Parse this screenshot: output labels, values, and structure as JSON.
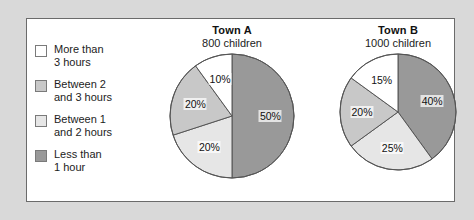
{
  "legend": {
    "items": [
      {
        "label": "More than\n3 hours",
        "color": "#ffffff"
      },
      {
        "label": "Between 2\nand 3 hours",
        "color": "#c8c8c8"
      },
      {
        "label": "Between 1\nand 2 hours",
        "color": "#e6e6e6"
      },
      {
        "label": "Less than\n1 hour",
        "color": "#999999"
      }
    ]
  },
  "colors": {
    "more_than_3_hours": "#ffffff",
    "between_2_and_3_hours": "#c8c8c8",
    "between_1_and_2_hours": "#e6e6e6",
    "less_than_1_hour": "#999999",
    "page_background": "#d9d9d9",
    "panel_background": "#ffffff",
    "panel_border": "#6b6b6b",
    "slice_outline": "#555555"
  },
  "chart_data": [
    {
      "type": "pie",
      "title": "Town A",
      "subtitle": "800 children",
      "categories": [
        "Less than 1 hour",
        "Between 1 and 2 hours",
        "Between 2 and 3 hours",
        "More than 3 hours"
      ],
      "values": [
        50,
        20,
        20,
        10
      ],
      "labels": [
        "50%",
        "20%",
        "20%",
        "10%"
      ],
      "colors": [
        "#999999",
        "#e6e6e6",
        "#c8c8c8",
        "#ffffff"
      ],
      "units": "percent",
      "total_children": 800,
      "radius": 62,
      "start_angle_deg": 0,
      "direction": "clockwise",
      "legend_position": "left"
    },
    {
      "type": "pie",
      "title": "Town B",
      "subtitle": "1000 children",
      "categories": [
        "Less than 1 hour",
        "Between 1 and 2 hours",
        "Between 2 and 3 hours",
        "More than 3 hours"
      ],
      "values": [
        40,
        25,
        20,
        15
      ],
      "labels": [
        "40%",
        "25%",
        "20%",
        "15%"
      ],
      "colors": [
        "#999999",
        "#e6e6e6",
        "#c8c8c8",
        "#ffffff"
      ],
      "units": "percent",
      "total_children": 1000,
      "radius": 58,
      "start_angle_deg": 0,
      "direction": "clockwise",
      "legend_position": "left"
    }
  ]
}
